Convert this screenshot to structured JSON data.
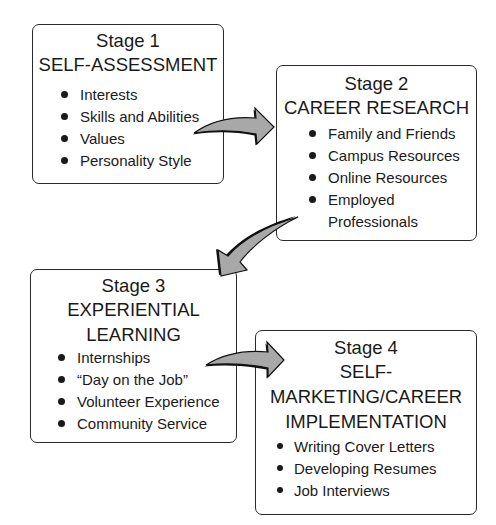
{
  "diagram": {
    "colors": {
      "border": "#2a2a2a",
      "text": "#1a1a1a",
      "arrow_fill": "#a8a8a8",
      "arrow_shadow": "#111111",
      "background": "#ffffff"
    },
    "stages": [
      {
        "label": "Stage 1",
        "title_lines": [
          "SELF-ASSESSMENT"
        ],
        "items": [
          "Interests",
          "Skills and Abilities",
          "Values",
          "Personality Style"
        ]
      },
      {
        "label": "Stage 2",
        "title_lines": [
          "CAREER RESEARCH"
        ],
        "items": [
          "Family and Friends",
          "Campus Resources",
          "Online Resources",
          "Employed",
          "Professionals"
        ]
      },
      {
        "label": "Stage 3",
        "title_lines": [
          "EXPERIENTIAL",
          "LEARNING"
        ],
        "items": [
          "Internships",
          "“Day on the Job”",
          "Volunteer Experience",
          "Community Service"
        ]
      },
      {
        "label": "Stage 4",
        "title_lines": [
          "SELF-",
          "MARKETING/CAREER",
          "IMPLEMENTATION"
        ],
        "items": [
          "Writing Cover Letters",
          "Developing Resumes",
          "Job Interviews"
        ]
      }
    ],
    "arrows": [
      {
        "from": "Stage 1",
        "to": "Stage 2",
        "icon": "curved-arrow-right-icon"
      },
      {
        "from": "Stage 2",
        "to": "Stage 3",
        "icon": "curved-arrow-down-left-icon"
      },
      {
        "from": "Stage 3",
        "to": "Stage 4",
        "icon": "curved-arrow-right-icon"
      }
    ]
  }
}
